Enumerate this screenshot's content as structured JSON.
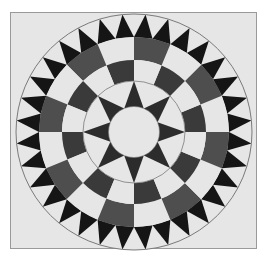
{
  "image": {
    "description": "Circular quilt-block mosaic: sawtooth ring of black triangles, two-ring checkerboard, 8-point star around a plain center circle",
    "frame": {
      "x": 10,
      "y": 12,
      "width": 247,
      "height": 237
    },
    "center": {
      "x": 134,
      "y": 132
    },
    "colors": {
      "page_background": "#ffffff",
      "frame_fill": "#e6e6e6",
      "frame_border": "#9a9a9a",
      "light_fill": "#e6e6e6",
      "sawtooth_dark": "#151515",
      "outer_ring_dark": "#4e4e4e",
      "inner_ring_dark": "#3a3a3a",
      "star_dark": "#2c2c2c",
      "outline": "#7a7a7a"
    },
    "rings": {
      "outer_circle_radius": 118,
      "sawtooth": {
        "count": 32,
        "outer_radius": 118,
        "inner_radius": 95
      },
      "checker_outer": {
        "segments": 16,
        "outer_radius": 95,
        "inner_radius": 72,
        "dark_first": false
      },
      "checker_inner": {
        "segments": 16,
        "outer_radius": 72,
        "inner_radius": 51,
        "dark_first": true
      },
      "star_circle_radius": 51,
      "star": {
        "points": 8,
        "tip_radius": 51,
        "base_radius": 25.5
      },
      "center_circle_radius": 25.5
    }
  }
}
